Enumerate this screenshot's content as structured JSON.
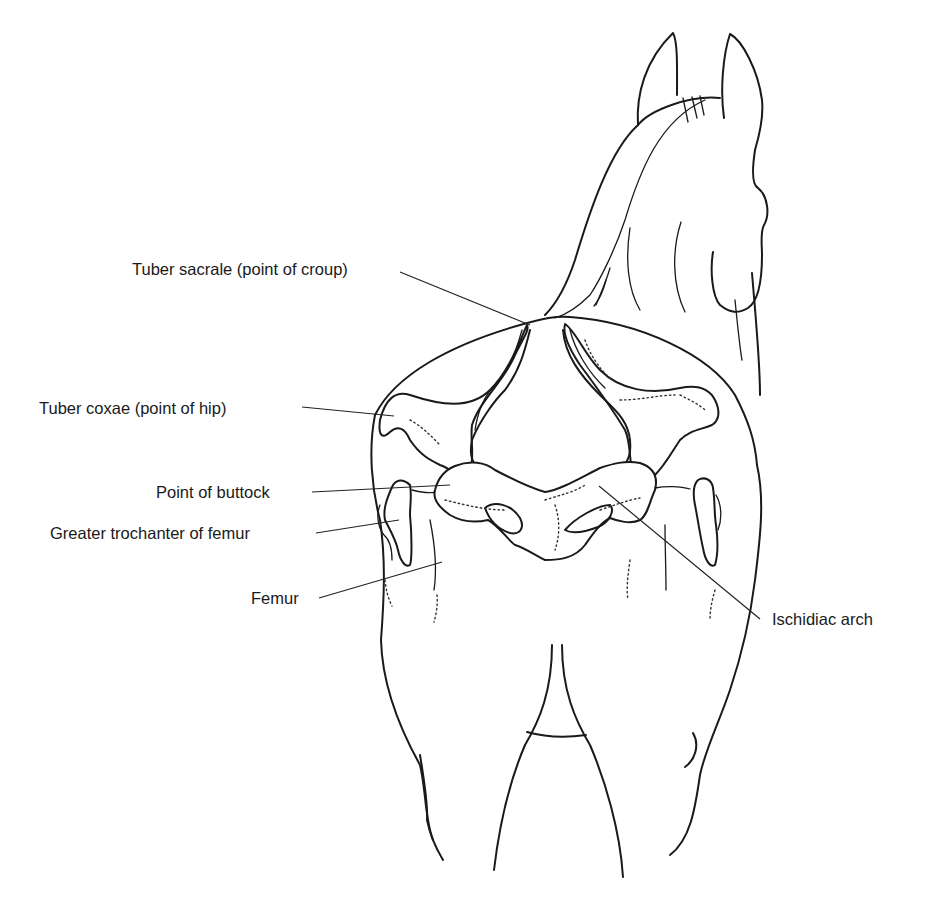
{
  "figure": {
    "line_color": "#1a1a1a",
    "background": "#ffffff"
  },
  "labels": [
    {
      "id": "tuber-sacrale",
      "text": "Tuber sacrale (point of croup)"
    },
    {
      "id": "tuber-coxae",
      "text": "Tuber coxae (point of hip)"
    },
    {
      "id": "point-of-buttock",
      "text": "Point of buttock"
    },
    {
      "id": "greater-trochanter",
      "text": "Greater trochanter of femur"
    },
    {
      "id": "femur",
      "text": "Femur"
    },
    {
      "id": "ischidiac-arch",
      "text": "Ischidiac arch"
    }
  ]
}
